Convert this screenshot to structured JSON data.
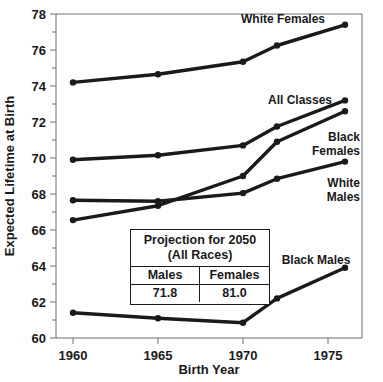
{
  "chart_data": {
    "type": "line",
    "title": "",
    "xlabel": "Birth Year",
    "ylabel": "Expected Lifetime  at Birth",
    "xlim": [
      1959,
      1977
    ],
    "ylim": [
      60,
      78
    ],
    "xticks": [
      "1960",
      "1965",
      "1970",
      "1975"
    ],
    "xtick_values": [
      1960,
      1965,
      1970,
      1975
    ],
    "yticks": [
      "60",
      "62",
      "64",
      "66",
      "68",
      "70",
      "72",
      "74",
      "76",
      "78"
    ],
    "ytick_values": [
      60,
      62,
      64,
      66,
      68,
      70,
      72,
      74,
      76,
      78
    ],
    "minor_y_step": 1,
    "grid": false,
    "legend": "inline-labels",
    "x": [
      1960,
      1965,
      1970,
      1972,
      1976
    ],
    "series": [
      {
        "name": "White Females",
        "label": "White Females",
        "values": [
          74.2,
          74.65,
          75.35,
          76.25,
          77.4
        ]
      },
      {
        "name": "All Classes",
        "label": "All Classes",
        "values": [
          69.9,
          70.15,
          70.7,
          71.75,
          73.2
        ]
      },
      {
        "name": "Black Females",
        "label": "Black\nFemales",
        "label_line1": "Black",
        "label_line2": "Females",
        "values": [
          66.55,
          67.35,
          69.0,
          70.9,
          72.6
        ]
      },
      {
        "name": "White Males",
        "label": "White\nMales",
        "label_line1": "White",
        "label_line2": "Males",
        "values": [
          67.65,
          67.6,
          68.05,
          68.85,
          69.8
        ]
      },
      {
        "name": "Black Males",
        "label": "Black Males",
        "values": [
          61.4,
          61.1,
          60.85,
          62.2,
          63.9
        ]
      }
    ]
  },
  "inset_table": {
    "title_line1": "Projection for 2050",
    "title_line2": "(All Races)",
    "headers": [
      "Males",
      "Females"
    ],
    "values": [
      "71.8",
      "81.0"
    ]
  },
  "colors": {
    "line": "#1a1a1a",
    "axis": "#6e6e6e",
    "text": "#1a1a1a",
    "background": "#ffffff"
  }
}
